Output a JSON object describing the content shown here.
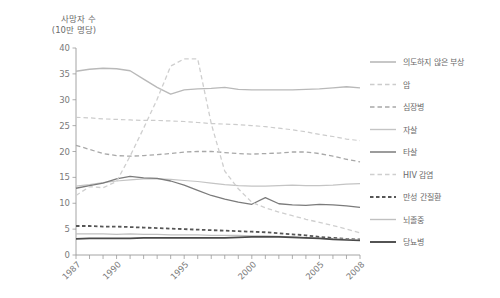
{
  "chart_data": {
    "type": "line",
    "title": "",
    "ylabel": "사망자 수\n(10만 명당)",
    "xlabel": "",
    "ylim": [
      0,
      40
    ],
    "yticks": [
      0,
      5,
      10,
      15,
      20,
      25,
      30,
      35,
      40
    ],
    "xlim": [
      1987,
      2008
    ],
    "xticks": [
      1987,
      1990,
      1995,
      2000,
      2005,
      2008
    ],
    "xtick_labels": [
      "1987",
      "1990",
      "1995",
      "2000",
      "2005",
      "2008"
    ],
    "grid": false,
    "legend_position": "right",
    "x": [
      1987,
      1988,
      1989,
      1990,
      1991,
      1992,
      1993,
      1994,
      1995,
      1996,
      1997,
      1998,
      1999,
      2000,
      2001,
      2002,
      2003,
      2004,
      2005,
      2006,
      2007,
      2008
    ],
    "series": [
      {
        "name": "의도하지 않은 부상",
        "color": "#b9b9b9",
        "style": "solid",
        "width": 1.4,
        "values": [
          35.5,
          35.9,
          36.1,
          36.0,
          35.6,
          34.0,
          32.4,
          31.1,
          31.9,
          32.1,
          32.2,
          32.4,
          32.0,
          31.9,
          31.9,
          31.9,
          31.9,
          32.0,
          32.1,
          32.3,
          32.5,
          32.3
        ]
      },
      {
        "name": "암",
        "color": "#cccccc",
        "style": "dashed",
        "width": 1.2,
        "values": [
          26.6,
          26.5,
          26.3,
          26.2,
          26.1,
          26.0,
          26.0,
          25.9,
          25.8,
          25.6,
          25.4,
          25.3,
          25.2,
          25.0,
          24.8,
          24.5,
          24.2,
          23.8,
          23.3,
          22.9,
          22.4,
          22.1
        ]
      },
      {
        "name": "심장병",
        "color": "#a8a8a8",
        "style": "dashed",
        "width": 1.3,
        "values": [
          21.2,
          20.4,
          19.6,
          19.2,
          19.1,
          19.2,
          19.4,
          19.6,
          19.9,
          20.0,
          20.0,
          19.8,
          19.6,
          19.5,
          19.6,
          19.7,
          19.9,
          19.9,
          19.6,
          19.1,
          18.5,
          18.0
        ]
      },
      {
        "name": "자살",
        "color": "#c4c4c4",
        "style": "solid",
        "width": 1.2,
        "values": [
          13.3,
          13.6,
          14.0,
          14.3,
          14.5,
          14.7,
          14.7,
          14.6,
          14.4,
          14.2,
          13.9,
          13.6,
          13.4,
          13.3,
          13.3,
          13.4,
          13.5,
          13.4,
          13.4,
          13.5,
          13.7,
          13.8
        ]
      },
      {
        "name": "타살",
        "color": "#7b7b7b",
        "style": "solid",
        "width": 1.3,
        "values": [
          12.9,
          13.4,
          13.9,
          14.7,
          15.2,
          14.9,
          14.8,
          14.3,
          13.5,
          12.5,
          11.5,
          10.8,
          10.2,
          9.8,
          11.1,
          9.9,
          9.7,
          9.6,
          9.8,
          9.7,
          9.5,
          9.2
        ]
      },
      {
        "name": "HIV 감염",
        "color": "#cfcfcf",
        "style": "dashed",
        "width": 1.3,
        "values": [
          11.5,
          13.2,
          13.0,
          14.2,
          19.1,
          24.5,
          30.1,
          36.5,
          37.9,
          37.9,
          25.4,
          16.2,
          12.8,
          10.2,
          9.1,
          8.3,
          7.6,
          6.9,
          6.3,
          5.7,
          5.0,
          4.3
        ]
      },
      {
        "name": "만성 간질환",
        "color": "#565656",
        "style": "dashed-bold",
        "width": 1.8,
        "values": [
          5.6,
          5.6,
          5.5,
          5.5,
          5.4,
          5.3,
          5.2,
          5.1,
          5.0,
          4.9,
          4.8,
          4.7,
          4.6,
          4.5,
          4.4,
          4.2,
          4.0,
          3.8,
          3.5,
          3.3,
          3.1,
          3.0
        ]
      },
      {
        "name": "뇌졸중",
        "color": "#c0c0c0",
        "style": "solid",
        "width": 1.2,
        "values": [
          4.1,
          4.1,
          4.1,
          4.0,
          4.1,
          4.0,
          4.0,
          3.9,
          3.9,
          3.9,
          3.8,
          3.8,
          3.8,
          3.7,
          3.7,
          3.6,
          3.5,
          3.3,
          3.2,
          3.1,
          3.0,
          2.9
        ]
      },
      {
        "name": "당뇨병",
        "color": "#4a4a4a",
        "style": "solid",
        "width": 1.7,
        "values": [
          3.1,
          3.2,
          3.2,
          3.2,
          3.2,
          3.3,
          3.3,
          3.3,
          3.3,
          3.3,
          3.3,
          3.3,
          3.4,
          3.5,
          3.5,
          3.5,
          3.4,
          3.3,
          3.2,
          3.0,
          2.9,
          2.8
        ]
      }
    ]
  },
  "axes": {
    "y_title": "사망자 수\n(10만 명당)"
  }
}
